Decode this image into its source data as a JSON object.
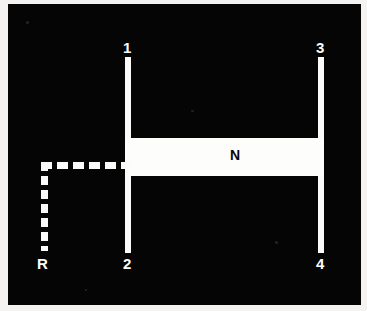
{
  "figure": {
    "title": "",
    "background_color": "#050505",
    "line_color": "#fbfbfa",
    "label_color": "#fcfcfb",
    "band_label_color": "#070707"
  },
  "labels": {
    "terminal_1": "1",
    "terminal_2": "2",
    "terminal_3": "3",
    "terminal_4": "4",
    "return_path": "R",
    "band": "N"
  },
  "elements": {
    "post_left": "solid vertical conductor joining terminal 1 and terminal 2",
    "post_right": "solid vertical conductor joining terminal 3 and terminal 4",
    "band_n": "solid horizontal bar labelled N bridging the two posts",
    "dashed_path": "dashed L-shaped return path labelled R"
  }
}
